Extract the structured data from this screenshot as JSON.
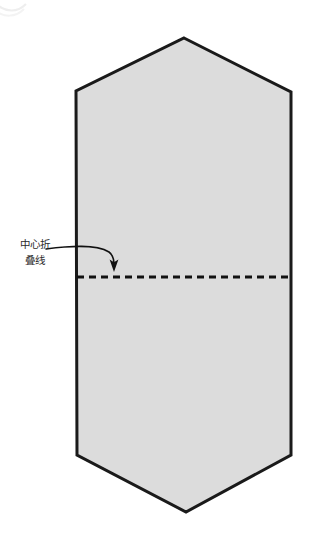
{
  "diagram": {
    "canvas": {
      "width": 314,
      "height": 539,
      "background": "#ffffff"
    },
    "shape": {
      "name": "folded-paper-outline",
      "description": "elongated hexagon sheet with pointed top and bottom",
      "fill_color": "#dcdcdc",
      "stroke_color": "#1a1a1a",
      "stroke_width": 3,
      "points": "184,38 291,92 291,455 186,512 77,455 76,91"
    },
    "fold_line": {
      "name": "center-fold-line",
      "style": "dashed",
      "color": "#111111",
      "stroke_width": 3,
      "dash_pattern": "7 5",
      "y": 277,
      "x_start": 77,
      "x_end": 291
    },
    "annotation": {
      "label_lines": [
        "中心折",
        "叠线"
      ],
      "full_text": "中心折叠线",
      "text_color": "#2b2b2b",
      "arrow": {
        "name": "curved-pointer-arrow",
        "color": "#111111",
        "stroke_width": 1.6,
        "path": "M 46,249 C 72,247 98,246 110,254",
        "head_tip_x": 114,
        "head_tip_y": 271
      }
    },
    "corner_artifact": {
      "name": "faint-corner-arc",
      "color": "#eeeeee"
    }
  }
}
